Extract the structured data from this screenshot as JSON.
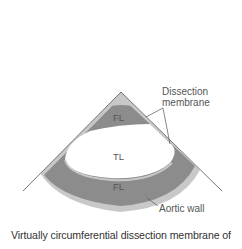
{
  "diagram": {
    "labels": {
      "dissection_membrane_line1": "Dissection",
      "dissection_membrane_line2": "membrane",
      "fl_top": "FL",
      "tl": "TL",
      "fl_bottom": "FL",
      "aortic_wall": "Aortic wall"
    },
    "colors": {
      "false_lumen": "#8c8c8c",
      "aortic_wall": "#c8c8c8",
      "true_lumen": "#ffffff",
      "lines": "#555555"
    }
  },
  "caption": "Virtually circumferential dissection membrane of"
}
